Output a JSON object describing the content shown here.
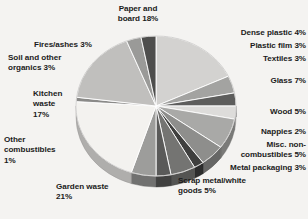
{
  "figure": {
    "background_color": "#f4f3f1",
    "text_color": "#1b1b1b",
    "pie": {
      "center_x": 156,
      "center_y": 106,
      "radius_x": 80,
      "radius_y": 70,
      "depth": 11,
      "start_angle_deg": -90,
      "slice_edge_color": "#ffffff"
    }
  },
  "chart_data": {
    "type": "pie",
    "title": "",
    "subtitle": "",
    "xlabel": "",
    "ylabel": "",
    "grid": false,
    "legend_position": "around-slices",
    "units": "percent",
    "total": 100,
    "categories": [
      "Paper and board",
      "Dense plastic",
      "Plastic film",
      "Textiles",
      "Glass",
      "Wood",
      "Nappies",
      "Misc. non-combustibles",
      "Metal packaging",
      "Scrap metal/white goods",
      "Garden waste",
      "Other combustibles",
      "Kitchen waste",
      "Soil and other organics",
      "Fires/ashes"
    ],
    "values": [
      18,
      4,
      3,
      3,
      7,
      5,
      2,
      5,
      3,
      5,
      21,
      1,
      17,
      3,
      3
    ],
    "colors": [
      "#d3d2d0",
      "#a3a3a1",
      "#5d5d5c",
      "#dddcda",
      "#a9a9a7",
      "#8e8e8c",
      "#3f3f3e",
      "#747472",
      "#5a5a59",
      "#9d9d9b",
      "#f3f2ef",
      "#8a8a88",
      "#c0bfbd",
      "#9a9a98",
      "#4e4e4d"
    ],
    "labels": [
      {
        "id": "paper-and-board",
        "text": "Paper and\nboard 18%",
        "align": "center",
        "x": 96,
        "y": 4,
        "width": 84
      },
      {
        "id": "dense-plastic",
        "text": "Dense plastic 4%",
        "align": "right",
        "x": 188,
        "y": 28,
        "width": 118
      },
      {
        "id": "plastic-film",
        "text": "Plastic film 3%",
        "align": "right",
        "x": 188,
        "y": 41,
        "width": 118
      },
      {
        "id": "textiles",
        "text": "Textiles 3%",
        "align": "right",
        "x": 188,
        "y": 54,
        "width": 118
      },
      {
        "id": "glass",
        "text": "Glass 7%",
        "align": "right",
        "x": 188,
        "y": 76,
        "width": 118
      },
      {
        "id": "wood",
        "text": "Wood 5%",
        "align": "right",
        "x": 188,
        "y": 107,
        "width": 118
      },
      {
        "id": "nappies",
        "text": "Nappies 2%",
        "align": "right",
        "x": 188,
        "y": 127,
        "width": 118
      },
      {
        "id": "misc-non-combustibles",
        "text": "Misc. non-\ncombustibles 5%",
        "align": "right",
        "x": 188,
        "y": 140,
        "width": 118
      },
      {
        "id": "metal-packaging",
        "text": "Metal packaging 3%",
        "align": "right",
        "x": 184,
        "y": 163,
        "width": 122
      },
      {
        "id": "scrap-metal-white-goods",
        "text": "Scrap metal/white\ngoods 5%",
        "align": "left",
        "x": 178,
        "y": 176,
        "width": 126
      },
      {
        "id": "garden-waste",
        "text": "Garden waste\n21%",
        "align": "left",
        "x": 56,
        "y": 182,
        "width": 98
      },
      {
        "id": "other-combustibles",
        "text": "Other\ncombustibles\n1%",
        "align": "left",
        "x": 4,
        "y": 135,
        "width": 84
      },
      {
        "id": "kitchen-waste",
        "text": "Kitchen\nwaste\n17%",
        "align": "left",
        "x": 33,
        "y": 89,
        "width": 72
      },
      {
        "id": "soil-and-other-organics",
        "text": "Soil and other\norganics 3%",
        "align": "left",
        "x": 8,
        "y": 53,
        "width": 94
      },
      {
        "id": "fires-ashes",
        "text": "Fires/ashes 3%",
        "align": "left",
        "x": 34,
        "y": 40,
        "width": 96
      }
    ]
  }
}
